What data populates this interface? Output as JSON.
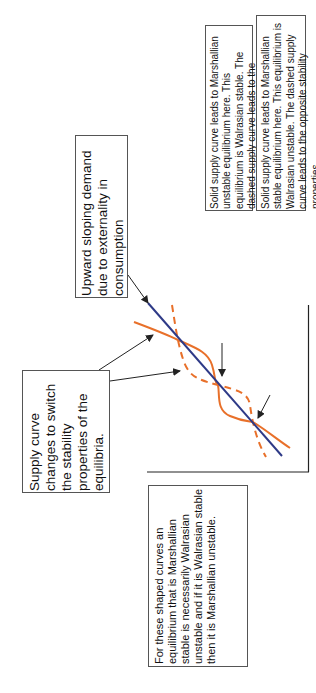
{
  "diagram": {
    "orientation": "rotated-90-ccw",
    "colors": {
      "demand_line": "#2e3a87",
      "supply_curve": "#e8702a",
      "box_border": "#555555",
      "arrow": "#222222",
      "axis": "#222222"
    },
    "curves": {
      "demand": {
        "label": "Upward sloping demand (straight line)",
        "style": "solid"
      },
      "supply_solid": {
        "label": "Solid supply curve",
        "style": "solid"
      },
      "supply_dashed": {
        "label": "Dashed supply curve",
        "style": "dashed"
      }
    },
    "equilibria_count": 3
  },
  "annotations": {
    "demand_note": "Upward sloping demand due to externality in consumption",
    "middle_equilibrium_note": "Solid supply curve leads to Marshallian unstable equilibrium here. This equilibrium is Walrasian stable. The dashed supply curve leads to the opposite stability properties.",
    "lower_equilibrium_note": "Solid supply curve leads to Marshallian stable equilibrium here. This equilibrium is Walrasian unstable. The dashed supply curve leads to the opposite stability properties.",
    "supply_switch_note": "Supply curve changes to switch the stability properties of the equilibria.",
    "summary_note": "For these shaped curves an equilibrium that is Marshallian stable is necessarily Walrasian unstable and if it is Walrasian stable then it is Marshallian unstable."
  }
}
